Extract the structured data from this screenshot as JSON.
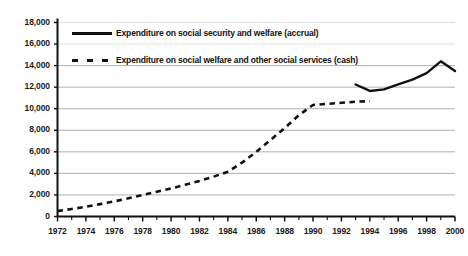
{
  "chart_data": {
    "type": "line",
    "title": "",
    "subtitle": "",
    "xlabel": "",
    "ylabel": "",
    "xlim": [
      1972,
      2000
    ],
    "ylim": [
      0,
      18000
    ],
    "ytick_step": 2000,
    "xtick_step": 2,
    "minor_xticks": "every 1 year",
    "grid": "horizontal gridlines at each 2,000 level",
    "legend_position": "inside top-left of plot area",
    "yticks": [
      "0",
      "2,000",
      "4,000",
      "6,000",
      "8,000",
      "10,000",
      "12,000",
      "14,000",
      "16,000",
      "18,000"
    ],
    "ytick_values": [
      0,
      2000,
      4000,
      6000,
      8000,
      10000,
      12000,
      14000,
      16000,
      18000
    ],
    "xticks": [
      "1972",
      "1974",
      "1976",
      "1978",
      "1980",
      "1982",
      "1984",
      "1986",
      "1988",
      "1990",
      "1992",
      "1994",
      "1996",
      "1998",
      "2000"
    ],
    "xtick_values": [
      1972,
      1974,
      1976,
      1978,
      1980,
      1982,
      1984,
      1986,
      1988,
      1990,
      1992,
      1994,
      1996,
      1998,
      2000
    ],
    "series": [
      {
        "name": "Expenditure on social welfare and other social services (cash)",
        "style": "dashed",
        "color": "#111111",
        "x": [
          1972,
          1973,
          1974,
          1975,
          1976,
          1977,
          1978,
          1979,
          1980,
          1981,
          1982,
          1983,
          1984,
          1985,
          1986,
          1987,
          1988,
          1989,
          1990,
          1991,
          1992,
          1993,
          1994
        ],
        "values": [
          500,
          700,
          900,
          1150,
          1400,
          1700,
          2000,
          2300,
          2600,
          2950,
          3300,
          3700,
          4150,
          5000,
          6000,
          7100,
          8200,
          9400,
          10350,
          10450,
          10550,
          10650,
          10700
        ]
      },
      {
        "name": "Expenditure on social security and welfare (accrual)",
        "style": "solid",
        "color": "#111111",
        "x": [
          1993,
          1994,
          1995,
          1996,
          1997,
          1998,
          1999,
          2000
        ],
        "values": [
          12250,
          11650,
          11800,
          12250,
          12700,
          13300,
          14400,
          13500
        ]
      }
    ],
    "legend": [
      {
        "label": "Expenditure on social security and welfare (accrual)",
        "style": "solid",
        "color": "#111111"
      },
      {
        "label": "Expenditure on social welfare and other social services (cash)",
        "style": "dashed",
        "color": "#111111"
      }
    ]
  }
}
